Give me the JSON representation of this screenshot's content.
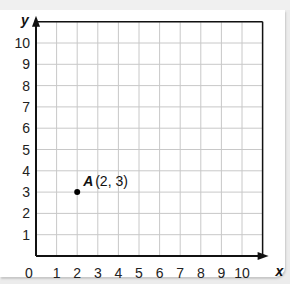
{
  "chart_data": {
    "type": "scatter",
    "title": "",
    "xlabel": "x",
    "ylabel": "y",
    "xlim": [
      0,
      11
    ],
    "ylim": [
      0,
      11
    ],
    "grid": true,
    "x_ticks": [
      "0",
      "1",
      "2",
      "3",
      "4",
      "5",
      "6",
      "7",
      "8",
      "9",
      "10"
    ],
    "y_ticks": [
      "1",
      "2",
      "3",
      "4",
      "5",
      "6",
      "7",
      "8",
      "9",
      "10"
    ],
    "origin_label": "0",
    "points": [
      {
        "label": "A",
        "coords": "(2, 3)",
        "x": 2,
        "y": 3
      }
    ]
  },
  "colors": {
    "grid": "#c8c8c8",
    "axis": "#111111",
    "point": "#000000",
    "background": "#ffffff"
  }
}
